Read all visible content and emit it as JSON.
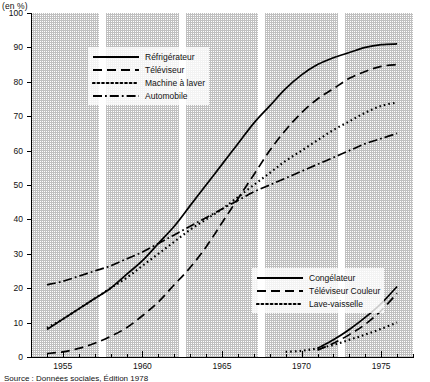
{
  "axis_unit_label": "(en %)",
  "caption": "Source : Données sociales, Édition 1978",
  "legend_primary": {
    "items": [
      {
        "label": "Réfrigérateur",
        "style": "solid"
      },
      {
        "label": "Téléviseur",
        "style": "dashed"
      },
      {
        "label": "Machine à laver",
        "style": "dotted"
      },
      {
        "label": "Automobile",
        "style": "dashdot"
      }
    ]
  },
  "legend_secondary": {
    "items": [
      {
        "label": "Congélateur",
        "style": "solid"
      },
      {
        "label": "Téléviseur Couleur",
        "style": "dashed"
      },
      {
        "label": "Lave-vaisselle",
        "style": "dotted"
      }
    ]
  },
  "chart_data": {
    "type": "line",
    "title": "",
    "subtitle": "",
    "xlabel": "",
    "ylabel": "(en %)",
    "xlim": [
      1953,
      1977
    ],
    "ylim": [
      0,
      100
    ],
    "ytick_labels": [
      "0",
      "10",
      "20",
      "30",
      "40",
      "50",
      "60",
      "70",
      "80",
      "90",
      "100"
    ],
    "ytick_values": [
      0,
      10,
      20,
      30,
      40,
      50,
      60,
      70,
      80,
      90,
      100
    ],
    "xtick_labels": [
      "1955",
      "1960",
      "1965",
      "1970",
      "1975"
    ],
    "xtick_values": [
      1955,
      1960,
      1965,
      1970,
      1975
    ],
    "xtick_minor_step": 1,
    "grid": false,
    "legend_position": "inside upper-left and inside lower-right",
    "band_shading": "alternating stippled vertical bands with white gaps at 1957.5, 1962.5, 1967.5, 1972.5",
    "series": [
      {
        "name": "Réfrigérateur",
        "style": "solid",
        "x": [
          1954,
          1955,
          1956,
          1957,
          1958,
          1959,
          1960,
          1961,
          1962,
          1963,
          1964,
          1965,
          1966,
          1967,
          1968,
          1969,
          1970,
          1971,
          1972,
          1973,
          1974,
          1975,
          1976
        ],
        "values": [
          8,
          11,
          14,
          17,
          20,
          24,
          28,
          33,
          38,
          44,
          50,
          56,
          62,
          68,
          73,
          78,
          82,
          85,
          87,
          88.5,
          90,
          90.8,
          91
        ]
      },
      {
        "name": "Téléviseur",
        "style": "dashed",
        "x": [
          1954,
          1955,
          1956,
          1957,
          1958,
          1959,
          1960,
          1961,
          1962,
          1963,
          1964,
          1965,
          1966,
          1967,
          1968,
          1969,
          1970,
          1971,
          1972,
          1973,
          1974,
          1975,
          1976
        ],
        "values": [
          1,
          1.5,
          2.5,
          4,
          6,
          8.5,
          12,
          16,
          21,
          26,
          32,
          39,
          46,
          53,
          60,
          66,
          71,
          75,
          78,
          81,
          83,
          84.5,
          85
        ]
      },
      {
        "name": "Machine à laver",
        "style": "dotted",
        "x": [
          1954,
          1955,
          1956,
          1957,
          1958,
          1959,
          1960,
          1961,
          1962,
          1963,
          1964,
          1965,
          1966,
          1967,
          1968,
          1969,
          1970,
          1971,
          1972,
          1973,
          1974,
          1975,
          1976
        ],
        "values": [
          8.5,
          11,
          14,
          17,
          20,
          23,
          26.5,
          30,
          33.5,
          37,
          40,
          43,
          46.5,
          50,
          53.5,
          57,
          60,
          63,
          66,
          68.5,
          71,
          73,
          74
        ]
      },
      {
        "name": "Automobile",
        "style": "dashdot",
        "x": [
          1954,
          1955,
          1956,
          1957,
          1958,
          1959,
          1960,
          1961,
          1962,
          1963,
          1964,
          1965,
          1966,
          1967,
          1968,
          1969,
          1970,
          1971,
          1972,
          1973,
          1974,
          1975,
          1976
        ],
        "values": [
          21,
          22,
          23.5,
          25,
          26.5,
          28.5,
          30.5,
          33,
          35.5,
          38,
          40.5,
          43,
          45.5,
          48,
          50,
          52,
          54,
          56,
          58,
          60,
          62,
          63.5,
          65
        ]
      },
      {
        "name": "Congélateur",
        "style": "solid",
        "x": [
          1971,
          1972,
          1973,
          1974,
          1975,
          1976
        ],
        "values": [
          2.5,
          5,
          8,
          11.5,
          15.5,
          20.5
        ]
      },
      {
        "name": "Téléviseur Couleur",
        "style": "dashed",
        "x": [
          1971,
          1972,
          1973,
          1974,
          1975,
          1976
        ],
        "values": [
          2,
          4,
          6.5,
          9.5,
          13.5,
          18.5
        ]
      },
      {
        "name": "Lave-vaisselle",
        "style": "dotted",
        "x": [
          1969,
          1970,
          1971,
          1972,
          1973,
          1974,
          1975,
          1976
        ],
        "values": [
          1.5,
          1.8,
          2.5,
          3.5,
          5,
          6.5,
          8.2,
          10
        ]
      }
    ]
  }
}
